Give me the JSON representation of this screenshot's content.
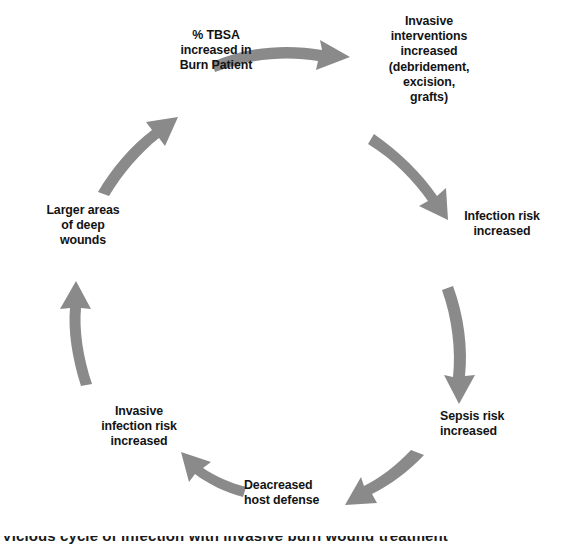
{
  "diagram": {
    "type": "cycle",
    "direction": "clockwise",
    "arrow_color": "#8a8a8a",
    "text_color": "#131313",
    "background_color": "#ffffff",
    "nodes": [
      {
        "id": "tbsa",
        "label": "% TBSA\nincreased  in\nBurn Patient"
      },
      {
        "id": "invasive_interventions",
        "label": "Invasive\ninterventions\nincreased\n(debridement,\nexcision,\ngrafts)"
      },
      {
        "id": "infection_risk",
        "label": "Infection risk\nincreased"
      },
      {
        "id": "sepsis_risk",
        "label": "Sepsis risk\nincreased"
      },
      {
        "id": "host_defense",
        "label": "Deacreased\nhost defense"
      },
      {
        "id": "invasive_infection_risk",
        "label": "Invasive\ninfection risk\nincreased"
      },
      {
        "id": "deep_wounds",
        "label": "Larger areas\nof deep\nwounds"
      }
    ],
    "arrows": [
      {
        "id": "arrow-tbsa-to-interventions",
        "from": "tbsa",
        "to": "invasive_interventions"
      },
      {
        "id": "arrow-interventions-to-infection",
        "from": "invasive_interventions",
        "to": "infection_risk"
      },
      {
        "id": "arrow-infection-to-sepsis",
        "from": "infection_risk",
        "to": "sepsis_risk"
      },
      {
        "id": "arrow-sepsis-to-hostdefense",
        "from": "sepsis_risk",
        "to": "host_defense"
      },
      {
        "id": "arrow-hostdefense-to-invasiveinfection",
        "from": "host_defense",
        "to": "invasive_infection_risk"
      },
      {
        "id": "arrow-invasiveinfection-to-wounds",
        "from": "invasive_infection_risk",
        "to": "deep_wounds"
      },
      {
        "id": "arrow-wounds-to-tbsa",
        "from": "deep_wounds",
        "to": "tbsa"
      }
    ]
  },
  "caption": {
    "text": "Vicious cycle of infection with invasive burn wound treatment"
  }
}
